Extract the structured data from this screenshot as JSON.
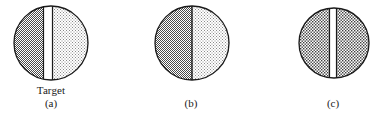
{
  "figure": {
    "background_color": "#ffffff",
    "stroke_color": "#1a1a1a",
    "dark_fill_color": "#6e6e6e",
    "light_fill_color": "#d9d9d9",
    "medium_fill_color": "#a8a8a8",
    "strip_fill_color": "#ffffff"
  },
  "annotations": {
    "target_label": "Target"
  },
  "panels": [
    {
      "id": "a",
      "caption": "(a)",
      "circle": {
        "cx": 38,
        "cy": 40,
        "r": 37
      },
      "left_region_shading": "dark-checker",
      "right_region_shading": "light-dots",
      "center_strip": {
        "present": true,
        "x_left": 30,
        "x_right": 40,
        "fill": "white",
        "bordered": true
      },
      "has_target_label": true
    },
    {
      "id": "b",
      "caption": "(b)",
      "circle": {
        "cx": 38,
        "cy": 40,
        "r": 37
      },
      "left_region_shading": "dark-checker",
      "right_region_shading": "light-dots",
      "center_strip": {
        "present": false,
        "x_left": 38,
        "x_right": 38,
        "fill": "none",
        "bordered": true
      },
      "has_target_label": false
    },
    {
      "id": "c",
      "caption": "(c)",
      "circle": {
        "cx": 36,
        "cy": 40,
        "r": 35
      },
      "left_region_shading": "medium-checker",
      "right_region_shading": "medium-checker",
      "center_strip": {
        "present": true,
        "x_left": 31,
        "x_right": 39,
        "fill": "white",
        "bordered": true
      },
      "has_target_label": false
    }
  ]
}
